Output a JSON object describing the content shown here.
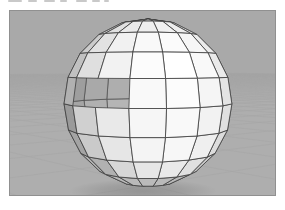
{
  "figure": {
    "type": "3d-render"
  },
  "frame": {
    "margin_color": "#ffffff",
    "border_color": "#909090",
    "artifact_color": "#c9c9c9",
    "artifacts": [
      {
        "x": 8,
        "w": 14
      },
      {
        "x": 28,
        "w": 9
      },
      {
        "x": 44,
        "w": 11
      },
      {
        "x": 60,
        "w": 7
      },
      {
        "x": 76,
        "w": 11
      },
      {
        "x": 92,
        "w": 8
      },
      {
        "x": 104,
        "w": 5
      }
    ]
  },
  "colors": {
    "sky": "#a9a9a9",
    "ground": "#aeaeae",
    "grid_line": "#999999",
    "edge": "#3d3d3d",
    "interior_edge": "#4c4c4c",
    "shadow": "#3a3a3a"
  },
  "camera": {
    "eye": [
      0.3,
      0.42,
      7.07
    ],
    "target": [
      0,
      -0.05,
      0
    ],
    "focal": 590,
    "screen_center": [
      138,
      96
    ],
    "near_clip": 0.5
  },
  "sphere": {
    "stacks": 10,
    "slices": 16,
    "radius": 1,
    "rotation_deg": -9,
    "light_dir": [
      0.3,
      0.45,
      0.84
    ],
    "ambient": 0.55,
    "diffuse": 0.45,
    "falloff": 0.6,
    "ground_bounce": 0.2,
    "interior_ambient": 0.52,
    "interior_diffuse": 0.2,
    "hole": {
      "row": 4,
      "azimuth_min_deg": -57,
      "azimuth_max_deg": -10
    }
  },
  "ground": {
    "plane_y": -1,
    "half_size": 120,
    "rotation_deg": -42,
    "grid_step": 1.5,
    "grid_opacity": 0.4,
    "grid_width": 0.5
  },
  "shadow": {
    "cx": 133,
    "cy": 180,
    "rx": 74,
    "ry": 12,
    "core_opacity": 0.22
  }
}
